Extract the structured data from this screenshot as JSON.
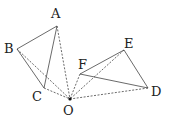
{
  "diagram": {
    "points": {
      "A": {
        "x": 57,
        "y": 26,
        "label": "A",
        "lx": 51,
        "ly": 7
      },
      "B": {
        "x": 17,
        "y": 49,
        "label": "B",
        "lx": 4,
        "ly": 42
      },
      "C": {
        "x": 44,
        "y": 88,
        "label": "C",
        "lx": 32,
        "ly": 90
      },
      "O": {
        "x": 70,
        "y": 99,
        "label": "O",
        "lx": 63,
        "ly": 104
      },
      "F": {
        "x": 80,
        "y": 74,
        "label": "F",
        "lx": 78,
        "ly": 58
      },
      "E": {
        "x": 124,
        "y": 50,
        "label": "E",
        "lx": 124,
        "ly": 37
      },
      "D": {
        "x": 148,
        "y": 88,
        "label": "D",
        "lx": 151,
        "ly": 85
      }
    },
    "solid_segments": [
      [
        "A",
        "B"
      ],
      [
        "B",
        "C"
      ],
      [
        "A",
        "C"
      ],
      [
        "F",
        "E"
      ],
      [
        "E",
        "D"
      ],
      [
        "F",
        "D"
      ]
    ],
    "dashed_segments": [
      [
        "A",
        "O"
      ],
      [
        "B",
        "O"
      ],
      [
        "C",
        "O"
      ],
      [
        "F",
        "O"
      ],
      [
        "E",
        "O"
      ],
      [
        "D",
        "O"
      ]
    ],
    "labels": [
      "A",
      "B",
      "C",
      "O",
      "F",
      "E",
      "D"
    ]
  }
}
